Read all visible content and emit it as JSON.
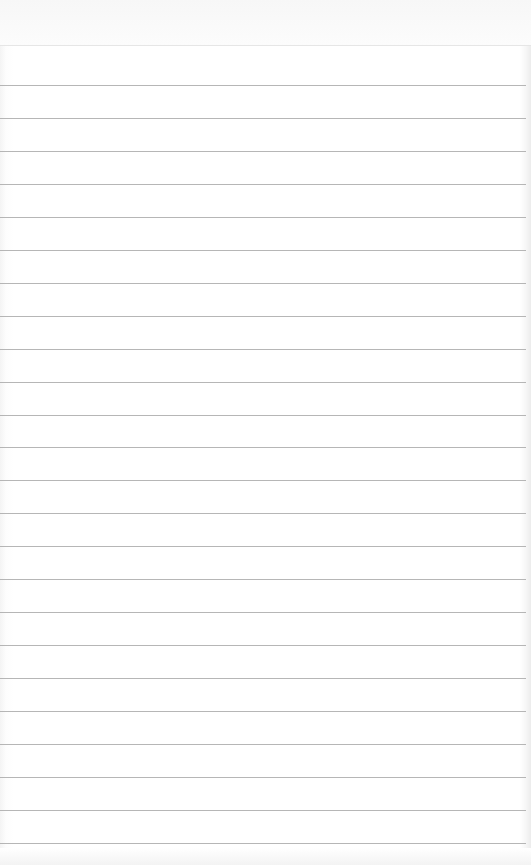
{
  "page": {
    "type": "lined-notepad",
    "title": "",
    "content_lines": [
      "",
      "",
      "",
      "",
      "",
      "",
      "",
      "",
      "",
      "",
      "",
      "",
      "",
      "",
      "",
      "",
      "",
      "",
      "",
      "",
      "",
      "",
      "",
      ""
    ]
  },
  "colors": {
    "paper": "#ffffff",
    "rule": "#a9a9a9",
    "top_rule": "#e6e6e6",
    "edge_shade": "#ececec"
  }
}
